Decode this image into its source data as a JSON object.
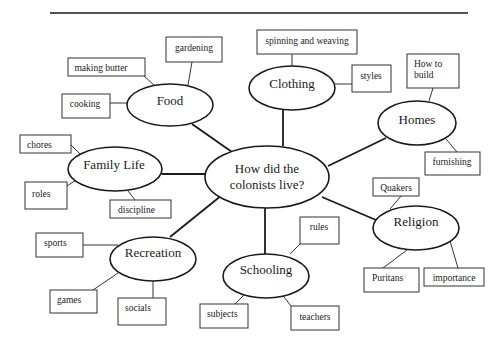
{
  "diagram": {
    "type": "concept-map",
    "center": {
      "id": "center",
      "lines": [
        "How did the",
        "colonists live?"
      ]
    },
    "topics": [
      {
        "id": "food",
        "label": "Food",
        "leaves": [
          "gardening",
          "making butter",
          "cooking"
        ]
      },
      {
        "id": "clothing",
        "label": "Clothing",
        "leaves": [
          "spinning and weaving",
          "styles"
        ]
      },
      {
        "id": "homes",
        "label": "Homes",
        "leaves": [
          "How to build",
          "furnishing"
        ]
      },
      {
        "id": "family-life",
        "label": "Family Life",
        "leaves": [
          "chores",
          "roles",
          "discipline"
        ]
      },
      {
        "id": "religion",
        "label": "Religion",
        "leaves": [
          "Quakers",
          "Puritans",
          "importance"
        ]
      },
      {
        "id": "recreation",
        "label": "Recreation",
        "leaves": [
          "sports",
          "games",
          "socials"
        ]
      },
      {
        "id": "schooling",
        "label": "Schooling",
        "leaves": [
          "rules",
          "subjects",
          "teachers"
        ]
      }
    ],
    "text": {
      "center_line1": "How did the",
      "center_line2": "colonists live?",
      "food": "Food",
      "gardening": "gardening",
      "making_butter": "making butter",
      "cooking": "cooking",
      "clothing": "Clothing",
      "spinning_and_weaving": "spinning and weaving",
      "styles": "styles",
      "homes": "Homes",
      "how_to_build_line1": "How to",
      "how_to_build_line2": "build",
      "furnishing": "furnishing",
      "family_life": "Family Life",
      "chores": "chores",
      "roles": "roles",
      "discipline": "discipline",
      "religion": "Religion",
      "quakers": "Quakers",
      "puritans": "Puritans",
      "importance": "importance",
      "recreation": "Recreation",
      "sports": "sports",
      "games": "games",
      "socials": "socials",
      "schooling": "Schooling",
      "rules": "rules",
      "subjects": "subjects",
      "teachers": "teachers"
    },
    "colors": {
      "stroke": "#1a1a1a",
      "background": "#ffffff"
    }
  }
}
